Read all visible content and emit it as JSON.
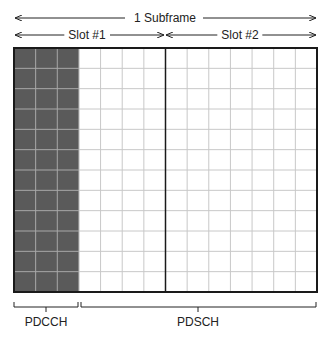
{
  "diagram": {
    "top_arrows": {
      "subframe_label": "1 Subframe",
      "slot1_label": "Slot #1",
      "slot2_label": "Slot #2"
    },
    "grid": {
      "columns": 14,
      "rows": 12,
      "slot_columns": 7,
      "control_columns": 3,
      "control_fill": "#5a5a5a",
      "data_fill": "#ffffff",
      "grid_line_color": "#c8c8c8",
      "border_color": "#1a1a1a"
    },
    "bottom_labels": {
      "control_region": "PDCCH",
      "data_region": "PDSCH"
    }
  }
}
